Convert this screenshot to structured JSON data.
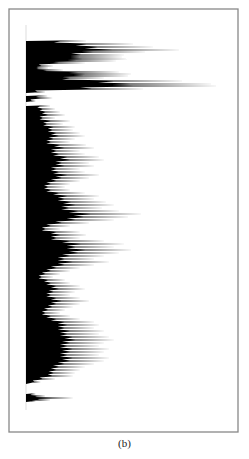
{
  "figure": {
    "caption": "(b)",
    "frame": {
      "x": 9,
      "y": 9,
      "width": 229,
      "height": 423,
      "stroke": "#888888"
    },
    "baseline_x": 26,
    "fill_color": "#000000"
  },
  "chart_data": {
    "type": "area",
    "orientation": "horizontal",
    "title": "",
    "xlabel": "",
    "ylabel": "",
    "legend": [],
    "grid": false,
    "note": "Spiky horizontal profile; y = vertical pixel position, v = spike length in px from baseline",
    "segments": [
      {
        "name": "top-block",
        "y_range": [
          41,
          92
        ],
        "spikes": [
          [
            41,
            62
          ],
          [
            44,
            110
          ],
          [
            47,
            130
          ],
          [
            50,
            157
          ],
          [
            52,
            122
          ],
          [
            55,
            100
          ],
          [
            57,
            98
          ],
          [
            59,
            103
          ],
          [
            61,
            92
          ],
          [
            63,
            60
          ],
          [
            66,
            28
          ],
          [
            68,
            23
          ],
          [
            70,
            38
          ],
          [
            72,
            95
          ],
          [
            74,
            108
          ],
          [
            76,
            105
          ],
          [
            78,
            80
          ],
          [
            81,
            160
          ],
          [
            84,
            190
          ],
          [
            86,
            195
          ],
          [
            89,
            120
          ],
          [
            92,
            20
          ]
        ]
      },
      {
        "name": "isolated-spike",
        "y_range": [
          96,
          101
        ],
        "spikes": [
          [
            96,
            22
          ],
          [
            98,
            27
          ],
          [
            101,
            10
          ]
        ]
      },
      {
        "name": "middle-block",
        "y_range": [
          106,
          383
        ],
        "spikes": [
          [
            106,
            25
          ],
          [
            109,
            30
          ],
          [
            112,
            35
          ],
          [
            115,
            40
          ],
          [
            118,
            30
          ],
          [
            121,
            45
          ],
          [
            124,
            38
          ],
          [
            127,
            50
          ],
          [
            130,
            48
          ],
          [
            133,
            55
          ],
          [
            136,
            60
          ],
          [
            139,
            50
          ],
          [
            142,
            45
          ],
          [
            145,
            62
          ],
          [
            148,
            70
          ],
          [
            151,
            55
          ],
          [
            154,
            60
          ],
          [
            157,
            75
          ],
          [
            160,
            80
          ],
          [
            163,
            65
          ],
          [
            166,
            70
          ],
          [
            169,
            55
          ],
          [
            172,
            60
          ],
          [
            175,
            75
          ],
          [
            178,
            65
          ],
          [
            181,
            55
          ],
          [
            184,
            45
          ],
          [
            187,
            40
          ],
          [
            190,
            45
          ],
          [
            193,
            60
          ],
          [
            196,
            75
          ],
          [
            199,
            70
          ],
          [
            202,
            82
          ],
          [
            205,
            90
          ],
          [
            208,
            78
          ],
          [
            211,
            95
          ],
          [
            214,
            118
          ],
          [
            217,
            105
          ],
          [
            220,
            90
          ],
          [
            223,
            65
          ],
          [
            226,
            45
          ],
          [
            229,
            35
          ],
          [
            232,
            55
          ],
          [
            235,
            62
          ],
          [
            238,
            55
          ],
          [
            241,
            80
          ],
          [
            244,
            100
          ],
          [
            247,
            90
          ],
          [
            250,
            108
          ],
          [
            253,
            95
          ],
          [
            256,
            80
          ],
          [
            259,
            70
          ],
          [
            262,
            85
          ],
          [
            265,
            70
          ],
          [
            268,
            55
          ],
          [
            271,
            45
          ],
          [
            274,
            35
          ],
          [
            277,
            28
          ],
          [
            280,
            40
          ],
          [
            283,
            45
          ],
          [
            286,
            55
          ],
          [
            289,
            60
          ],
          [
            292,
            50
          ],
          [
            295,
            45
          ],
          [
            298,
            55
          ],
          [
            301,
            65
          ],
          [
            304,
            55
          ],
          [
            307,
            48
          ],
          [
            310,
            40
          ],
          [
            313,
            35
          ],
          [
            316,
            45
          ],
          [
            319,
            55
          ],
          [
            322,
            70
          ],
          [
            325,
            75
          ],
          [
            328,
            70
          ],
          [
            331,
            80
          ],
          [
            334,
            75
          ],
          [
            337,
            85
          ],
          [
            340,
            90
          ],
          [
            343,
            80
          ],
          [
            346,
            75
          ],
          [
            349,
            85
          ],
          [
            352,
            80
          ],
          [
            355,
            75
          ],
          [
            358,
            85
          ],
          [
            361,
            80
          ],
          [
            364,
            70
          ],
          [
            367,
            60
          ],
          [
            370,
            55
          ],
          [
            373,
            50
          ],
          [
            376,
            48
          ],
          [
            379,
            30
          ],
          [
            382,
            15
          ]
        ]
      },
      {
        "name": "bottom-spike",
        "y_range": [
          394,
          401
        ],
        "spikes": [
          [
            394,
            10
          ],
          [
            396,
            20
          ],
          [
            398,
            48
          ],
          [
            400,
            25
          ],
          [
            401,
            10
          ]
        ]
      }
    ]
  }
}
